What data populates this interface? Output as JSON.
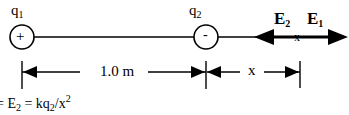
{
  "diagram": {
    "charges": [
      {
        "name": "q",
        "sub": "1",
        "sign": "+"
      },
      {
        "name": "q",
        "sub": "2",
        "sign": "-"
      }
    ],
    "fields": [
      {
        "name": "E",
        "sub": "2",
        "direction": "left"
      },
      {
        "name": "E",
        "sub": "1",
        "direction": "right"
      }
    ],
    "point_marker": "x",
    "dimensions": [
      {
        "label": "1.0 m",
        "from": "q1",
        "to": "q2"
      },
      {
        "label": "x",
        "from": "q2",
        "to": "point"
      }
    ],
    "equation": {
      "prefix": "= E",
      "prefix_sub": "2",
      "middle": " = kq",
      "middle_sub": "2",
      "suffix": "/x",
      "suffix_sup": "2"
    }
  }
}
